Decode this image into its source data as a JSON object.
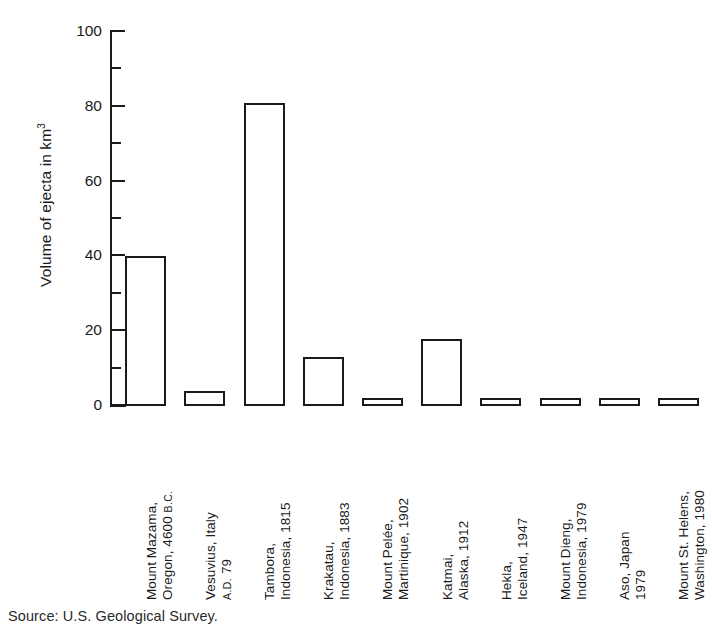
{
  "chart_data": {
    "type": "bar",
    "title": "",
    "xlabel": "",
    "ylabel": "Volume of ejecta in km",
    "ylabel_superscript": "3",
    "ylim": [
      0,
      100
    ],
    "ytick_major_step": 20,
    "ytick_minor_step": 10,
    "ytick_labels": [
      "0",
      "20",
      "40",
      "60",
      "80",
      "100"
    ],
    "ytick_values": [
      0,
      20,
      40,
      60,
      80,
      100
    ],
    "grid": false,
    "legend": false,
    "bar_style": "outline",
    "bar_fill": "#ffffff",
    "bar_stroke": "#1a1a1a",
    "categories": [
      "Mount Mazama, Oregon, 4600 B.C.",
      "Vesuvius, Italy A.D. 79",
      "Tambora, Indonesia, 1815",
      "Krakatau, Indonesia, 1883",
      "Mount Pelée, Martinique, 1902",
      "Katmai, Alaska, 1912",
      "Hekla, Iceland, 1947",
      "Mount Dieng, Indonesia, 1979",
      "Aso, Japan 1979",
      "Mount St. Helens, Washington, 1980"
    ],
    "values": [
      40,
      4,
      81,
      13,
      1,
      18,
      0.5,
      1,
      0.5,
      1
    ],
    "bars": [
      {
        "line1": "Mount Mazama,",
        "line2": "Oregon, 4600 ",
        "era": "B.C.",
        "era_position": "line2-suffix",
        "value": 40
      },
      {
        "line1": "Vesuvius, Italy",
        "line2": "",
        "era": "A.D.",
        "era_suffix": " 79",
        "era_position": "line2-prefix",
        "value": 4
      },
      {
        "line1": "Tambora,",
        "line2": "Indonesia, 1815",
        "era": "",
        "value": 81
      },
      {
        "line1": "Krakatau,",
        "line2": "Indonesia, 1883",
        "era": "",
        "value": 13
      },
      {
        "line1": "Mount Pelée,",
        "line2": "Martinique, 1902",
        "era": "",
        "value": 1
      },
      {
        "line1": "Katmai,",
        "line2": "Alaska, 1912",
        "era": "",
        "value": 18
      },
      {
        "line1": "Hekla,",
        "line2": "Iceland, 1947",
        "era": "",
        "value": 0.5
      },
      {
        "line1": "Mount Dieng,",
        "line2": "Indonesia, 1979",
        "era": "",
        "value": 1
      },
      {
        "line1": "Aso, Japan",
        "line2": "1979",
        "era": "",
        "value": 0.5
      },
      {
        "line1": "Mount St. Helens,",
        "line2": "Washington, 1980",
        "era": "",
        "value": 1
      }
    ]
  },
  "source": {
    "text": "Source: U.S. Geological Survey."
  },
  "colors": {
    "ink": "#1a1a1a",
    "background": "#ffffff"
  }
}
